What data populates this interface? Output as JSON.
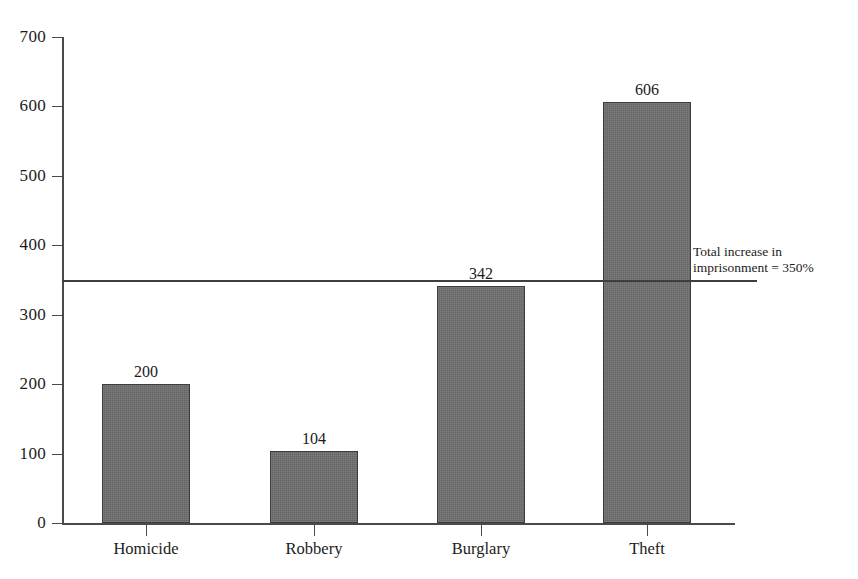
{
  "chart_data": {
    "type": "bar",
    "title": "",
    "subtitle": "",
    "xlabel": "",
    "ylabel": "",
    "categories": [
      "Homicide",
      "Robbery",
      "Burglary",
      "Theft"
    ],
    "values": [
      200,
      104,
      342,
      606
    ],
    "value_labels": [
      "200",
      "104",
      "342",
      "606"
    ],
    "ylim": [
      0,
      700
    ],
    "ytick_values": [
      0,
      100,
      200,
      300,
      400,
      500,
      600,
      700
    ],
    "ytick_labels": [
      "0",
      "100",
      "200",
      "300",
      "400",
      "500",
      "600",
      "700"
    ],
    "grid": false,
    "legend": null,
    "series": [
      {
        "name": "Percent increase in imprisonment",
        "values": [
          200,
          104,
          342,
          606
        ]
      }
    ],
    "annotations": [
      {
        "name": "total-increase-reference",
        "type": "hline",
        "value": 350,
        "label_line_1": "Total increase in",
        "label_line_2": "imprisonment = 350%"
      }
    ],
    "colors": {
      "bar_fill": "#6f6f6f",
      "bar_stroke": "#3d3d3d",
      "axis": "#4a4a4a",
      "reference_line": "#3f3f3f",
      "text": "#1b1b1b",
      "background": "#ffffff"
    }
  }
}
